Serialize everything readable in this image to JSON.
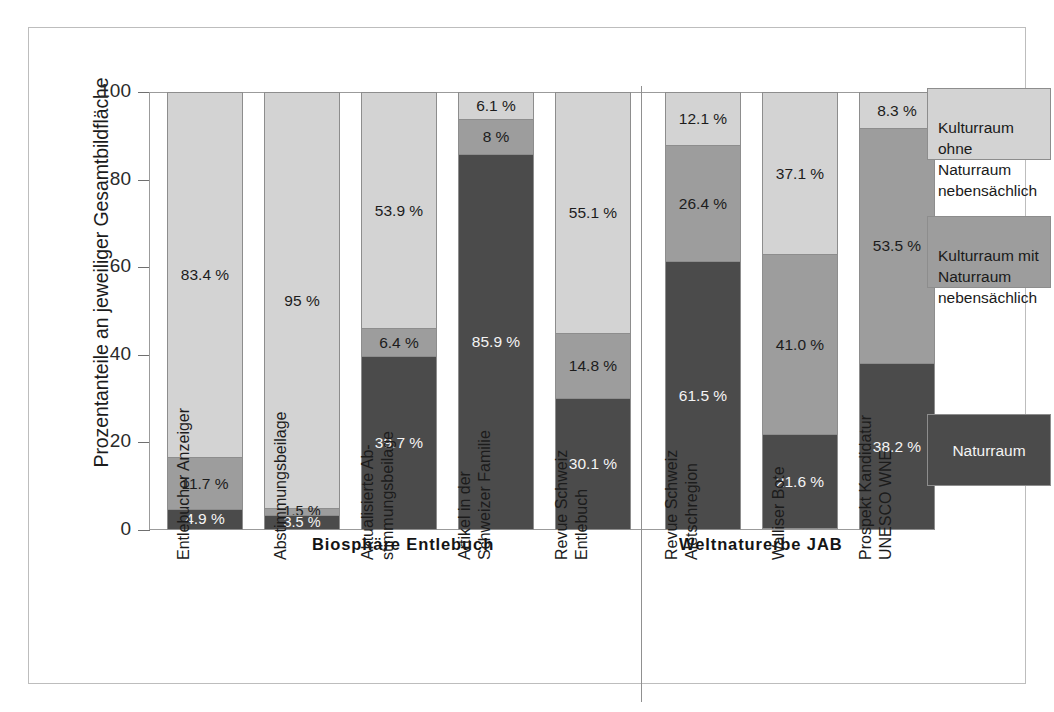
{
  "chart_data": {
    "type": "bar",
    "subtype": "stacked-bar-100",
    "title": "",
    "xlabel": "",
    "ylabel": "Prozentanteile an jeweiliger Gesamtbildfläche",
    "ylim": [
      0,
      100
    ],
    "yticks": [
      "0",
      "20",
      "40",
      "60",
      "80",
      "100"
    ],
    "ytick_values": [
      0,
      20,
      40,
      60,
      80,
      100
    ],
    "grid": false,
    "legend_position": "right",
    "categories": [
      "Entlebucher Anzeiger",
      "Abstimmungsbeilage",
      "Aktualisierte Ab-\nstimmungsbeilage",
      "Artikel in der\nSchweizer Familie",
      "Revue Schweiz\nEntlebuch",
      "Revue Schweiz\nAletschregion",
      "Walliser Bote",
      "Prospekt Kandidatur\nUNESCO WNE"
    ],
    "series": [
      {
        "name": "Naturraum",
        "color": "#4b4b4b",
        "values": [
          4.9,
          3.5,
          39.7,
          85.9,
          30.1,
          61.5,
          21.6,
          38.2
        ],
        "labels": [
          "4.9 %",
          "3.5 %",
          "39.7 %",
          "85.9 %",
          "30.1 %",
          "61.5 %",
          "21.6 %",
          "38.2 %"
        ]
      },
      {
        "name": "Kulturraum mit Naturraum nebensächlich",
        "color": "#9d9d9d",
        "values": [
          11.7,
          1.5,
          6.4,
          8.0,
          14.8,
          26.4,
          41.0,
          53.5
        ],
        "labels": [
          "11.7 %",
          "1.5 %",
          "6.4 %",
          "8 %",
          "14.8 %",
          "26.4 %",
          "41.0 %",
          "53.5 %"
        ]
      },
      {
        "name": "Kulturraum ohne Naturraum nebensächlich",
        "color": "#d3d3d3",
        "values": [
          83.4,
          95.0,
          53.9,
          6.1,
          55.1,
          12.1,
          37.1,
          8.3
        ],
        "labels": [
          "83.4 %",
          "95 %",
          "53.9 %",
          "6.1 %",
          "55.1 %",
          "12.1 %",
          "37.1 %",
          "8.3 %"
        ]
      }
    ],
    "groups": [
      {
        "label": "Biosphäre Entlebuch",
        "categories": [
          0,
          1,
          2,
          3,
          4
        ]
      },
      {
        "label": "Weltnaturerbe JAB",
        "categories": [
          5,
          6,
          7
        ]
      }
    ],
    "legend": [
      {
        "label": "Kulturraum ohne\nNaturraum\nnebensächlich",
        "color": "#d3d3d3",
        "text_color": "#1c1c1c"
      },
      {
        "label": "Kulturraum mit\nNaturraum\nnebensächlich",
        "color": "#9d9d9d",
        "text_color": "#1c1c1c"
      },
      {
        "label": "Naturraum",
        "color": "#4b4b4b",
        "text_color": "#f4f4f4"
      }
    ]
  },
  "axis": {
    "y_title": "Prozentanteile an jeweiliger Gesamtbildfläche",
    "ticks": [
      {
        "label": "100",
        "value": 100
      },
      {
        "label": "80",
        "value": 80
      },
      {
        "label": "60",
        "value": 60
      },
      {
        "label": "40",
        "value": 40
      },
      {
        "label": "20",
        "value": 20
      },
      {
        "label": "0",
        "value": 0
      }
    ]
  },
  "groups": {
    "left": "Biosphäre Entlebuch",
    "right": "Weltnaturerbe JAB"
  },
  "xlabels": [
    "Entlebucher Anzeiger",
    "Abstimmungsbeilage",
    "Aktualisierte Ab-\nstimmungsbeilage",
    "Artikel in der\nSchweizer Familie",
    "Revue Schweiz\nEntlebuch",
    "Revue Schweiz\nAletschregion",
    "Walliser Bote",
    "Prospekt Kandidatur\nUNESCO WNE"
  ],
  "bars": [
    {
      "name": "Entlebucher Anzeiger",
      "segments": [
        {
          "label": "83.4 %",
          "value": 83.4,
          "tone": "light"
        },
        {
          "label": "11.7 %",
          "value": 11.7,
          "tone": "mid"
        },
        {
          "label": "4.9 %",
          "value": 4.9,
          "tone": "dark"
        }
      ]
    },
    {
      "name": "Abstimmungsbeilage",
      "segments": [
        {
          "label": "95 %",
          "value": 95.0,
          "tone": "light"
        },
        {
          "label": "1.5 %",
          "value": 1.5,
          "tone": "mid"
        },
        {
          "label": "3.5 %",
          "value": 3.5,
          "tone": "dark"
        }
      ]
    },
    {
      "name": "Aktualisierte Abstimmungsbeilage",
      "segments": [
        {
          "label": "53.9 %",
          "value": 53.9,
          "tone": "light"
        },
        {
          "label": "6.4 %",
          "value": 6.4,
          "tone": "mid"
        },
        {
          "label": "39.7 %",
          "value": 39.7,
          "tone": "dark"
        }
      ]
    },
    {
      "name": "Artikel in der Schweizer Familie",
      "segments": [
        {
          "label": "6.1 %",
          "value": 6.1,
          "tone": "light"
        },
        {
          "label": "8 %",
          "value": 8.0,
          "tone": "mid"
        },
        {
          "label": "85.9 %",
          "value": 85.9,
          "tone": "dark"
        }
      ]
    },
    {
      "name": "Revue Schweiz Entlebuch",
      "segments": [
        {
          "label": "55.1 %",
          "value": 55.1,
          "tone": "light"
        },
        {
          "label": "14.8 %",
          "value": 14.8,
          "tone": "mid"
        },
        {
          "label": "30.1 %",
          "value": 30.1,
          "tone": "dark"
        }
      ]
    },
    {
      "name": "Revue Schweiz Aletschregion",
      "segments": [
        {
          "label": "12.1 %",
          "value": 12.1,
          "tone": "light"
        },
        {
          "label": "26.4 %",
          "value": 26.4,
          "tone": "mid"
        },
        {
          "label": "61.5 %",
          "value": 61.5,
          "tone": "dark"
        }
      ]
    },
    {
      "name": "Walliser Bote",
      "segments": [
        {
          "label": "37.1 %",
          "value": 37.1,
          "tone": "light"
        },
        {
          "label": "41.0 %",
          "value": 41.0,
          "tone": "mid"
        },
        {
          "label": "21.6 %",
          "value": 21.6,
          "tone": "dark"
        }
      ]
    },
    {
      "name": "Prospekt Kandidatur UNESCO WNE",
      "segments": [
        {
          "label": "8.3 %",
          "value": 8.3,
          "tone": "light"
        },
        {
          "label": "53.5 %",
          "value": 53.5,
          "tone": "mid"
        },
        {
          "label": "38.2 %",
          "value": 38.2,
          "tone": "dark"
        }
      ]
    }
  ],
  "legend": [
    {
      "label": "Kulturraum ohne\nNaturraum\nnebensächlich",
      "tone": "light"
    },
    {
      "label": "Kulturraum mit\nNaturraum\nnebensächlich",
      "tone": "mid"
    },
    {
      "label": "Naturraum",
      "tone": "dark"
    }
  ],
  "colors": {
    "light": "#d3d3d3",
    "mid": "#9d9d9d",
    "dark": "#4b4b4b",
    "frame": "#bdbdbd",
    "axis": "#6f6f6f",
    "bar_edge": "#8d8d8d"
  },
  "layout": {
    "bar_x": [
      138,
      235,
      332,
      429,
      526,
      636,
      733,
      830
    ],
    "bar_width": 76,
    "plot_left": 120,
    "plot_top": 64,
    "plot_height": 438,
    "divider_x": 612
  }
}
